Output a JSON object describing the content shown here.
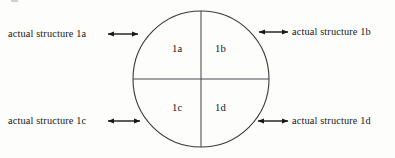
{
  "figure": {
    "background_color": "#fdfdfc",
    "ink_color": "#17171a",
    "line_color": "#3a3a3e",
    "circle": {
      "center_x": 201,
      "center_y": 79,
      "radius": 68,
      "stroke_width": 1.1
    },
    "dividers": {
      "vertical_label": "vertical-divider",
      "horizontal_label": "horizontal-divider"
    }
  },
  "quadrants": [
    {
      "key": "1a",
      "label": "1a",
      "position": "top-left",
      "x": 172,
      "y": 44
    },
    {
      "key": "1b",
      "label": "1b",
      "position": "top-right",
      "x": 215,
      "y": 44
    },
    {
      "key": "1c",
      "label": "1c",
      "position": "bottom-left",
      "x": 172,
      "y": 103
    },
    {
      "key": "1d",
      "label": "1d",
      "position": "bottom-right",
      "x": 215,
      "y": 103
    }
  ],
  "callouts": [
    {
      "key": "1a",
      "text": "actual structure 1a",
      "side": "left",
      "text_x": 8,
      "text_y": 29,
      "arrow": {
        "x1": 108,
        "y1": 34,
        "x2": 138,
        "y2": 34
      }
    },
    {
      "key": "1b",
      "text": "actual structure 1b",
      "side": "right",
      "text_x": 292,
      "text_y": 27,
      "arrow": {
        "x1": 259,
        "y1": 32,
        "x2": 288,
        "y2": 32
      }
    },
    {
      "key": "1c",
      "text": "actual structure 1c",
      "side": "left",
      "text_x": 8,
      "text_y": 116,
      "arrow": {
        "x1": 108,
        "y1": 121,
        "x2": 140,
        "y2": 121
      }
    },
    {
      "key": "1d",
      "text": "actual structure 1d",
      "side": "right",
      "text_x": 292,
      "text_y": 116,
      "arrow": {
        "x1": 258,
        "y1": 121,
        "x2": 288,
        "y2": 121
      }
    }
  ]
}
